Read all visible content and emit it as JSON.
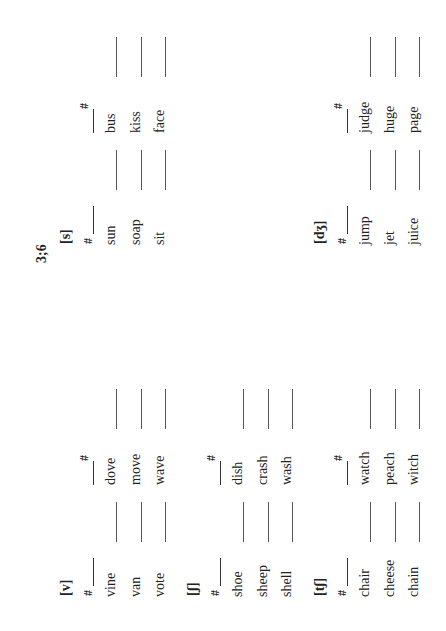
{
  "page_label": "3;6",
  "sections": [
    {
      "id": "s",
      "label": "[s]",
      "initial_header": "#",
      "final_header": "#",
      "initial_words": [
        "sun",
        "soap",
        "sit"
      ],
      "final_words": [
        "bus",
        "kiss",
        "face"
      ]
    },
    {
      "id": "dzh",
      "label": "[dʒ]",
      "initial_header": "#",
      "final_header": "#",
      "initial_words": [
        "jump",
        "jet",
        "juice"
      ],
      "final_words": [
        "judge",
        "huge",
        "page"
      ]
    },
    {
      "id": "v",
      "label": "[v]",
      "initial_header": "#",
      "final_header": "#",
      "initial_words": [
        "vine",
        "van",
        "vote"
      ],
      "final_words": [
        "dove",
        "move",
        "wave"
      ]
    },
    {
      "id": "sh",
      "label": "[ʃ]",
      "initial_header": "#",
      "final_header": "#",
      "initial_words": [
        "shoe",
        "sheep",
        "shell"
      ],
      "final_words": [
        "dish",
        "crash",
        "wash"
      ]
    },
    {
      "id": "ch",
      "label": "[tʃ]",
      "initial_header": "#",
      "final_header": "#",
      "initial_words": [
        "chair",
        "cheese",
        "chain"
      ],
      "final_words": [
        "watch",
        "peach",
        "witch"
      ]
    }
  ]
}
